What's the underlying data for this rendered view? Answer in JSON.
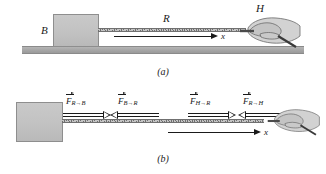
{
  "figure": {
    "type": "physics-free-body-diagram",
    "colors": {
      "block_fill": "#c2c2c2",
      "block_border": "#8e8e8e",
      "ground_fill": "#a8a8a8",
      "rope_dark": "#6f6f6f",
      "rope_light": "#c4c4c4",
      "ink": "#1a1a1a",
      "background": "#ffffff"
    }
  },
  "panel_a": {
    "caption": "(a)",
    "block_label": "B",
    "rope_label": "R",
    "hand_label": "H",
    "axis_label": "x"
  },
  "panel_b": {
    "caption": "(b)",
    "axis_label": "x",
    "forces": [
      {
        "symbol": "F",
        "from": "R",
        "to": "B",
        "arrow": "→",
        "direction": "right",
        "label": "F_R→B"
      },
      {
        "symbol": "F",
        "from": "B",
        "to": "R",
        "arrow": "→",
        "direction": "left",
        "label": "F_B→R"
      },
      {
        "symbol": "F",
        "from": "H",
        "to": "R",
        "arrow": "→",
        "direction": "right",
        "label": "F_H→R"
      },
      {
        "symbol": "F",
        "from": "R",
        "to": "H",
        "arrow": "→",
        "direction": "left",
        "label": "F_R→H"
      }
    ]
  }
}
